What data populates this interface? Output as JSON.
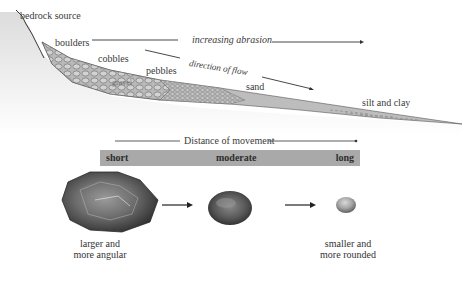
{
  "diagram": {
    "profile_labels": {
      "source": "bedrock source",
      "boulders": "boulders",
      "cobbles": "cobbles",
      "gravel": "gravel",
      "pebbles": "pebbles",
      "sand": "sand",
      "silt_clay": "silt and clay"
    },
    "arrows": {
      "abrasion": "increasing abrasion",
      "flow": "direction of flow",
      "distance": "Distance of movement"
    },
    "distance_scale": {
      "short": "short",
      "moderate": "moderate",
      "long": "long"
    },
    "rocks": {
      "large_caption_line1": "larger and",
      "large_caption_line2": "more angular",
      "small_caption_line1": "smaller and",
      "small_caption_line2": "more rounded"
    },
    "colors": {
      "bar": "#a9a9a9",
      "sediment": "#bdbdbd",
      "ground": "#e6e6e6",
      "line": "#333333"
    }
  }
}
